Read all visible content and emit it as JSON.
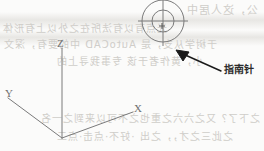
{
  "figure": {
    "background_color": "#fbfbfa",
    "line_color": "#7a7a7a",
    "arrow_color": "#1a1a1a",
    "text_color": "#2b2b2b",
    "axis_label_color": "#6f6f6f",
    "bleed_color": "#cfcdc9"
  },
  "axes": {
    "origin": {
      "x": 62,
      "y": 138
    },
    "z_axis": {
      "label": "Z",
      "end_x": 62,
      "end_y": 48,
      "label_x": 57,
      "label_y": 39
    },
    "x_axis": {
      "label": "X",
      "end_x": 133,
      "end_y": 112,
      "label_x": 134,
      "label_y": 104
    },
    "y_axis": {
      "label": "Y",
      "end_x": 8,
      "end_y": 98,
      "label_x": 5,
      "label_y": 89
    }
  },
  "compass": {
    "name": "compass-widget",
    "center_x": 163,
    "center_y": 21,
    "outer_radius": 21,
    "inner_radius": 11,
    "crosshair_overshoot": 6,
    "center_marker": "plus"
  },
  "callout": {
    "label": "指南针",
    "label_x": 224,
    "label_y": 65,
    "arrow_tail_x": 222,
    "arrow_tail_y": 72,
    "arrow_head_x": 177,
    "arrow_head_y": 51
  },
  "bleed_text": {
    "lines": [
      {
        "text": "公，这人居中",
        "x": 186,
        "y": 1,
        "size": 11
      },
      {
        "text": "光点有以有法所在之外以上有形体",
        "x": 2,
        "y": 20,
        "size": 10
      },
      {
        "text": "于树学从支，是 AutoCAD 中的要有，深文",
        "x": 3,
        "y": 36,
        "size": 10
      },
      {
        "text": "小，黄作者于该 专事我寻上的",
        "x": 56,
        "y": 53,
        "size": 10
      },
      {
        "text": "之下了？又之六六之重也之不可以来到之一名",
        "x": 40,
        "y": 110,
        "size": 10
      },
      {
        "text": "之此三之才，，之出 ·好不·点击·点二",
        "x": 56,
        "y": 128,
        "size": 10
      }
    ],
    "bands": [
      {
        "y": 14,
        "height": 16
      },
      {
        "y": 30,
        "height": 14
      }
    ]
  }
}
